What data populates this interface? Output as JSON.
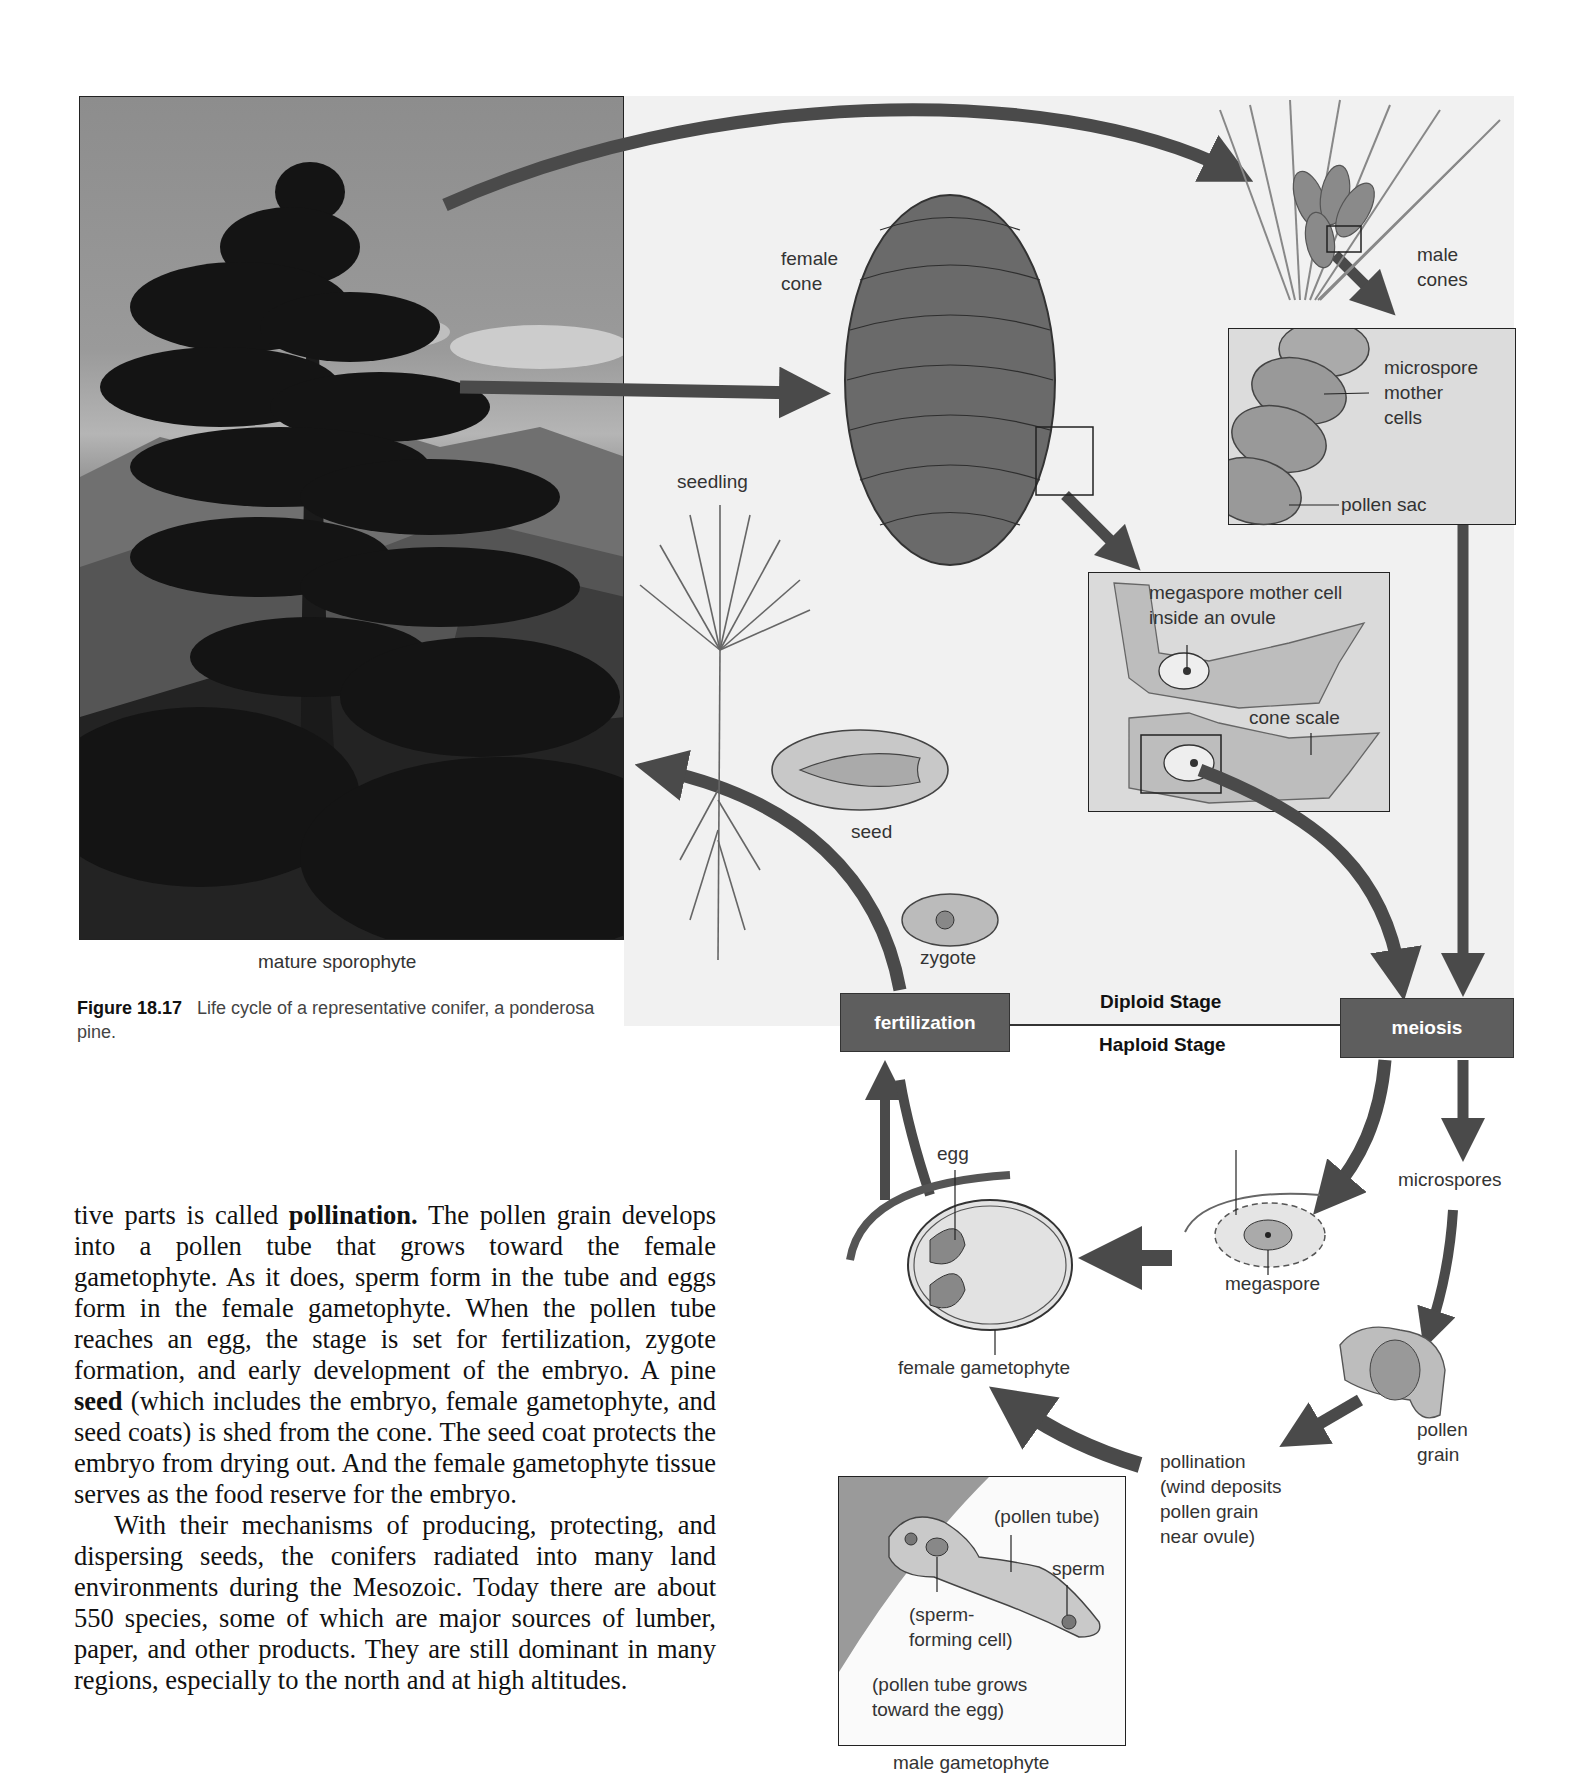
{
  "figure": {
    "number": "Figure 18.17",
    "caption": "Life cycle of a representative conifer, a ponderosa pine.",
    "photo_label": "mature sporophyte"
  },
  "diagram": {
    "labels": {
      "female_cone_line1": "female",
      "female_cone_line2": "cone",
      "male_cones_line1": "male",
      "male_cones_line2": "cones",
      "microspore_line1": "microspore",
      "microspore_line2": "mother",
      "microspore_line3": "cells",
      "pollen_sac": "pollen sac",
      "megaspore_mc_line1": "megaspore mother cell",
      "megaspore_mc_line2": "inside an ovule",
      "cone_scale": "cone scale",
      "seedling": "seedling",
      "seed": "seed",
      "zygote": "zygote",
      "egg": "egg",
      "megaspore": "megaspore",
      "microspores": "microspores",
      "female_gametophyte": "female gametophyte",
      "pollen_grain_line1": "pollen",
      "pollen_grain_line2": "grain",
      "pollination_line1": "pollination",
      "pollination_line2": "(wind deposits",
      "pollination_line3": "pollen grain",
      "pollination_line4": "near ovule)",
      "pollen_tube": "(pollen tube)",
      "sperm": "sperm",
      "sperm_forming_line1": "(sperm-",
      "sperm_forming_line2": "forming cell)",
      "tube_grows_line1": "(pollen tube grows",
      "tube_grows_line2": "toward the egg)",
      "male_gametophyte": "male gametophyte"
    },
    "stages": {
      "fertilization": "fertilization",
      "meiosis": "meiosis",
      "diploid": "Diploid Stage",
      "haploid": "Haploid Stage"
    },
    "colors": {
      "arrow": "#4a4a4a",
      "stage_box": "#5e5e5e",
      "diploid_bg": "#f1f1f1",
      "inset_bg": "#d8d8d8"
    }
  },
  "body": {
    "paragraph1_pre": "tive parts is called ",
    "paragraph1_bold1": "pollination.",
    "paragraph1_mid": " The pollen grain develops into a pollen tube that grows toward the female gametophyte. As it does, sperm form in the tube and eggs form in the female gametophyte. When the pollen tube reaches an egg, the stage is set for fertilization, zygote formation, and early development of the embryo. A pine ",
    "paragraph1_bold2": "seed",
    "paragraph1_post": " (which includes the embryo, female gametophyte, and seed coats) is shed from the cone. The seed coat protects the embryo from drying out. And the female gametophyte tissue serves as the food reserve for the embryo.",
    "paragraph2": "With their mechanisms of producing, protecting, and dispersing seeds, the conifers radiated into many land environments during the Mesozoic. Today there are about 550 species, some of which are major sources of lumber, paper, and other products. They are still dominant in many regions, especially to the north and at high altitudes."
  }
}
